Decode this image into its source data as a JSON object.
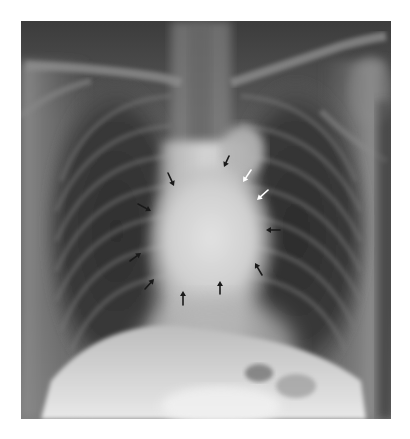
{
  "figure": {
    "type": "chest-radiograph",
    "view": "PA",
    "frame": {
      "x": 21,
      "y": 21,
      "width": 370,
      "height": 398
    },
    "background_color": "#ffffff",
    "film_base_color": "#4a4a4a"
  },
  "annotations": {
    "arrows": [
      {
        "id": "a1",
        "color": "#1a1a1a",
        "from": [
          229,
          156
        ],
        "to": [
          224,
          167
        ],
        "direction": "down-left"
      },
      {
        "id": "a2",
        "color": "#ffffff",
        "from": [
          251,
          170
        ],
        "to": [
          243,
          182
        ],
        "direction": "down-left"
      },
      {
        "id": "a3",
        "color": "#ffffff",
        "from": [
          268,
          190
        ],
        "to": [
          257,
          200
        ],
        "direction": "down-left"
      },
      {
        "id": "a4",
        "color": "#1a1a1a",
        "from": [
          168,
          173
        ],
        "to": [
          174,
          186
        ],
        "direction": "down-right"
      },
      {
        "id": "a5",
        "color": "#1a1a1a",
        "from": [
          138,
          204
        ],
        "to": [
          151,
          211
        ],
        "direction": "down-right"
      },
      {
        "id": "a6",
        "color": "#1a1a1a",
        "from": [
          280,
          230
        ],
        "to": [
          266,
          230
        ],
        "direction": "left"
      },
      {
        "id": "a7",
        "color": "#1a1a1a",
        "from": [
          130,
          261
        ],
        "to": [
          141,
          253
        ],
        "direction": "up-right"
      },
      {
        "id": "a8",
        "color": "#1a1a1a",
        "from": [
          262,
          275
        ],
        "to": [
          255,
          263
        ],
        "direction": "up-left"
      },
      {
        "id": "a9",
        "color": "#1a1a1a",
        "from": [
          145,
          289
        ],
        "to": [
          154,
          279
        ],
        "direction": "up-right"
      },
      {
        "id": "a10",
        "color": "#1a1a1a",
        "from": [
          183,
          305
        ],
        "to": [
          183,
          291
        ],
        "direction": "up"
      },
      {
        "id": "a11",
        "color": "#1a1a1a",
        "from": [
          220,
          294
        ],
        "to": [
          220,
          281
        ],
        "direction": "up"
      }
    ]
  }
}
